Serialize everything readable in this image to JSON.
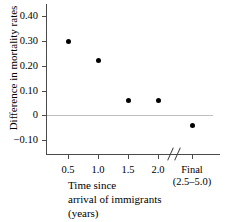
{
  "chart_data": {
    "type": "scatter",
    "title": "",
    "xlabel": "Time since arrival of immigrants (years)",
    "ylabel": "Difference in mortality rates",
    "categories": [
      "0.5",
      "1.0",
      "1.5",
      "2.0",
      "Final"
    ],
    "x_tick_sublabels": [
      "",
      "",
      "",
      "",
      "(2.5–5.0)"
    ],
    "values": [
      0.3,
      0.22,
      0.06,
      0.06,
      -0.04
    ],
    "ylim": [
      -0.16,
      0.45
    ],
    "y_ticks": [
      0.4,
      0.3,
      0.2,
      0.1,
      0.0,
      -0.1
    ],
    "y_tick_labels": [
      "0.40",
      "0.30",
      "0.20",
      "0.10",
      "0",
      "−0.10"
    ],
    "grid": false,
    "legend": false,
    "zero_reference_line": 0.0,
    "axis_break": {
      "between": [
        "2.0",
        "Final"
      ],
      "style": "double-slash"
    },
    "colors": {
      "marker": "#000000",
      "axis": "#4a4a4a",
      "zero_line": "#bfbfbf"
    }
  },
  "xcaption": {
    "line1": "Time since",
    "line2": "arrival of immigrants",
    "line3": "(years)"
  }
}
